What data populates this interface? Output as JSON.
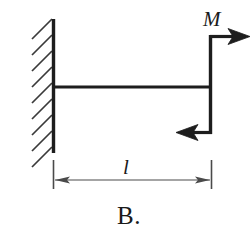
{
  "figure": {
    "caption": "B.",
    "moment_label": "M",
    "length_label": "l",
    "stroke_color": "#1d1d1d",
    "hatch_color": "#3a3a3a",
    "dimension_color": "#4a4a4a",
    "background_color": "#ffffff",
    "parts": {
      "wall_name": "fixed-support-wall",
      "beam_name": "horizontal-beam",
      "riser_name": "vertical-member",
      "top_arrow_name": "top-force-arrow-right",
      "bottom_arrow_name": "bottom-force-arrow-left",
      "dimension_name": "length-dimension"
    },
    "hatch_count": 9,
    "geometry": {
      "wall_x": 53,
      "wall_top": 20,
      "wall_bottom": 153,
      "beam_y": 87,
      "beam_right_x": 211,
      "riser_top_y": 36,
      "riser_bottom_y": 133,
      "top_arrow_tip_x": 250,
      "bottom_arrow_tip_x": 176,
      "dimension_y": 180
    }
  }
}
